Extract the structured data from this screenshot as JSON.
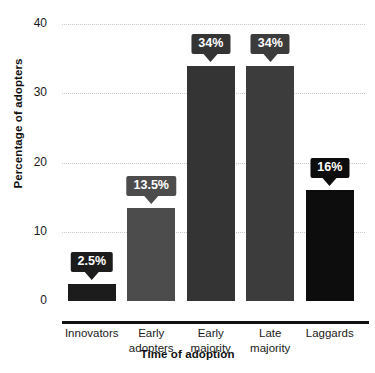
{
  "chart_data": {
    "type": "bar",
    "title": "",
    "xlabel": "Time of adoption",
    "ylabel": "Percentage of adopters",
    "categories": [
      "Innovators",
      "Early adopters",
      "Early majority",
      "Late majority",
      "Laggards"
    ],
    "category_lines": [
      [
        "Innovators"
      ],
      [
        "Early",
        "adopters"
      ],
      [
        "Early",
        "majority"
      ],
      [
        "Late",
        "majority"
      ],
      [
        "Laggards"
      ]
    ],
    "values": [
      2.5,
      13.5,
      34,
      34,
      16
    ],
    "data_labels": [
      "2.5%",
      "13.5%",
      "34%",
      "34%",
      "16%"
    ],
    "bar_colors": [
      "#1c1c1c",
      "#4c4c4c",
      "#343434",
      "#3c3c3c",
      "#0d0d0d"
    ],
    "label_box_colors": [
      "#1c1c1c",
      "#4c4c4c",
      "#343434",
      "#3c3c3c",
      "#0d0d0d"
    ],
    "ylim": [
      0,
      40
    ],
    "yticks": [
      0,
      10,
      20,
      30,
      40
    ],
    "ytick_labels": [
      "0",
      "10",
      "20",
      "30",
      "40"
    ],
    "grid": true,
    "grid_style": "dotted",
    "grid_color": "#c9c9c9",
    "legend": "none",
    "axis_color": "#111111",
    "background": "#ffffff"
  }
}
